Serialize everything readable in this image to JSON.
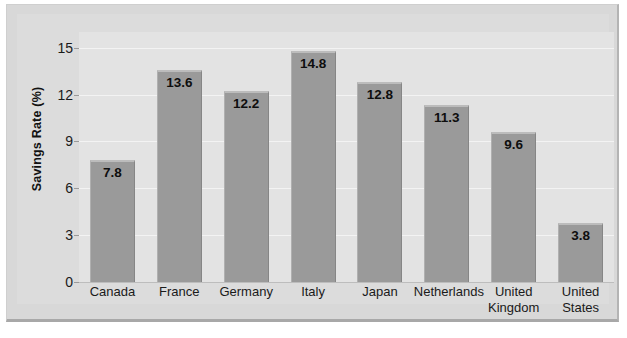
{
  "chart_data": {
    "type": "bar",
    "title": "",
    "xlabel": "",
    "ylabel": "Savings Rate (%)",
    "categories": [
      "Canada",
      "France",
      "Germany",
      "Italy",
      "Japan",
      "Netherlands",
      "United Kingdom",
      "United States"
    ],
    "category_lines": [
      [
        "Canada"
      ],
      [
        "France"
      ],
      [
        "Germany"
      ],
      [
        "Italy"
      ],
      [
        "Japan"
      ],
      [
        "Netherlands"
      ],
      [
        "United",
        "Kingdom"
      ],
      [
        "United",
        "States"
      ]
    ],
    "values": [
      7.8,
      13.6,
      12.2,
      14.8,
      12.8,
      11.3,
      9.6,
      3.8
    ],
    "value_labels": [
      "7.8",
      "13.6",
      "12.2",
      "14.8",
      "12.8",
      "11.3",
      "9.6",
      "3.8"
    ],
    "ylim": [
      0,
      16
    ],
    "yticks": [
      0,
      3,
      6,
      9,
      12,
      15
    ],
    "ytick_labels": [
      "0",
      "3",
      "6",
      "9",
      "12",
      "15"
    ],
    "grid": true,
    "legend": false,
    "colors": {
      "bar_fill": "#9a9a9a",
      "bar_top_highlight": "#bcbcbc",
      "plot_background": "#e3e3e3",
      "frame_background": "#dcdcdc",
      "gridline": "#f3f3f3",
      "axis_line": "#bdbdbd",
      "text": "#1a1a1a"
    }
  }
}
